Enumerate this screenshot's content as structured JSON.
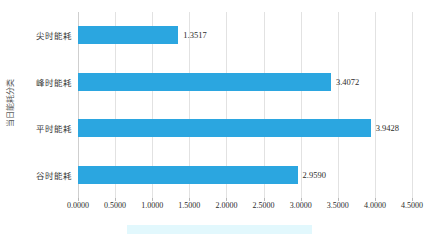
{
  "chart_data": {
    "type": "bar",
    "orientation": "horizontal",
    "title": "",
    "xlabel": "",
    "ylabel": "当日能耗分类",
    "categories": [
      "尖时能耗",
      "峰时能耗",
      "平时能耗",
      "谷时能耗"
    ],
    "values": [
      1.3517,
      3.4072,
      3.9428,
      2.959
    ],
    "value_labels": [
      "1.3517",
      "3.4072",
      "3.9428",
      "2.9590"
    ],
    "xlim": [
      0.0,
      4.5
    ],
    "xticks": [
      0.0,
      0.5,
      1.0,
      1.5,
      2.0,
      2.5,
      3.0,
      3.5,
      4.0,
      4.5
    ],
    "xtick_labels": [
      "0.0000",
      "0.5000",
      "1.0000",
      "1.5000",
      "2.0000",
      "2.5000",
      "3.0000",
      "3.5000",
      "4.0000",
      "4.5000"
    ],
    "grid": "vertical",
    "legend_position": "bottom",
    "series_color": "#2ba6e0"
  },
  "colors": {
    "bar": "#2ba6e0",
    "gridline": "#e2e2e2",
    "axis_text": "#2b2b2b",
    "category_text": "#3a3a3a",
    "axis_title_text": "#5a5a5a",
    "legend_band": "#e2f8fd",
    "background": "#ffffff"
  }
}
